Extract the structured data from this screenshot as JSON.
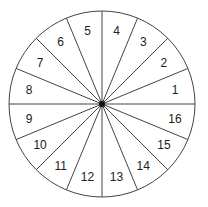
{
  "diagram": {
    "type": "segmented-circle",
    "center": [
      102,
      104
    ],
    "radius": 93,
    "segment_count": 16,
    "stroke_color": "#444444",
    "hub_color": "#111111",
    "segments": [
      {
        "label": "1",
        "x": 176,
        "y": 124
      },
      {
        "label": "2",
        "x": 164,
        "y": 92
      },
      {
        "label": "3",
        "x": 143,
        "y": 66
      },
      {
        "label": "4",
        "x": 117,
        "y": 54
      },
      {
        "label": "5",
        "x": 88,
        "y": 54
      },
      {
        "label": "6",
        "x": 63,
        "y": 66
      },
      {
        "label": "7",
        "x": 41,
        "y": 92
      },
      {
        "label": "8",
        "x": 30,
        "y": 124
      },
      {
        "label": "9",
        "x": 30,
        "y": 143
      },
      {
        "label": "10",
        "x": 41,
        "y": 174
      },
      {
        "label": "11",
        "x": 63,
        "y": 200
      },
      {
        "label": "12",
        "x": 88,
        "y": 212
      },
      {
        "label": "13",
        "x": 117,
        "y": 212
      },
      {
        "label": "14",
        "x": 143,
        "y": 200
      },
      {
        "label": "15",
        "x": 164,
        "y": 174
      },
      {
        "label": "16",
        "x": 176,
        "y": 143
      }
    ]
  }
}
